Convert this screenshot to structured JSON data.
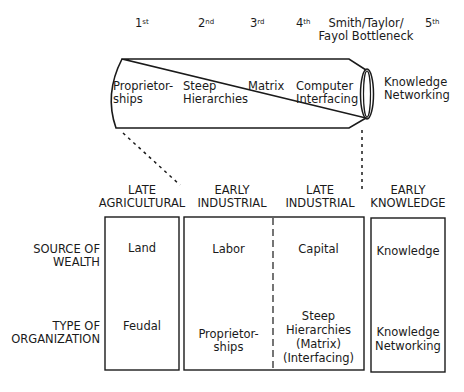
{
  "waves": [
    {
      "num": "1",
      "suffix": "st"
    },
    {
      "num": "2",
      "suffix": "nd"
    },
    {
      "num": "3",
      "suffix": "rd"
    },
    {
      "num": "4",
      "suffix": "th"
    },
    {
      "num": "5",
      "suffix": "th"
    }
  ],
  "bottleneck": {
    "line1": "Smith/Taylor/",
    "line2": "Fayol Bottleneck"
  },
  "pipe_labels": [
    {
      "line1": "Proprietor-",
      "line2": "ships"
    },
    {
      "line1": "Steep",
      "line2": "Hierarchies"
    },
    {
      "line1": "Matrix",
      "line2": ""
    },
    {
      "line1": "Computer",
      "line2": "Interfacing"
    }
  ],
  "outside_label": {
    "line1": "Knowledge",
    "line2": "Networking"
  },
  "eras": [
    {
      "line1": "LATE",
      "line2": "AGRICULTURAL"
    },
    {
      "line1": "EARLY",
      "line2": "INDUSTRIAL"
    },
    {
      "line1": "LATE",
      "line2": "INDUSTRIAL"
    },
    {
      "line1": "EARLY",
      "line2": "KNOWLEDGE"
    }
  ],
  "row_labels": {
    "wealth": {
      "line1": "SOURCE OF",
      "line2": "WEALTH"
    },
    "org": {
      "line1": "TYPE OF",
      "line2": "ORGANIZATION"
    }
  },
  "cells": {
    "wealth": [
      "Land",
      "Labor",
      "Capital",
      "Knowledge"
    ],
    "org": [
      [
        "Feudal"
      ],
      [
        "Proprietor-",
        "ships"
      ],
      [
        "Steep",
        "Hierarchies",
        "(Matrix)",
        "(Interfacing)"
      ],
      [
        "Knowledge",
        "Networking"
      ]
    ]
  }
}
